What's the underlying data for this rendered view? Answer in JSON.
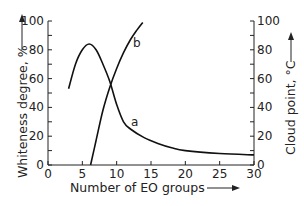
{
  "chart_data": {
    "type": "line",
    "title": "",
    "xlabel": "Number of EO groups",
    "ylabel_left": "Whiteness degree, %",
    "ylabel_right": "Cloud point, °C",
    "xlim": [
      0,
      30
    ],
    "ylim_left": [
      0,
      100
    ],
    "ylim_right": [
      0,
      100
    ],
    "x_ticks": [
      "0",
      "5",
      "10",
      "15",
      "20",
      "25",
      "30"
    ],
    "y_ticks_left": [
      "0",
      "20",
      "40",
      "60",
      "80",
      "100"
    ],
    "y_ticks_right": [
      "0",
      "20",
      "40",
      "60",
      "80",
      "100"
    ],
    "grid": false,
    "series": [
      {
        "name": "a",
        "axis": "left",
        "label": "a",
        "x": [
          3,
          4,
          5,
          6,
          7,
          8,
          9,
          10,
          11,
          12,
          14,
          16,
          18,
          20,
          25,
          30
        ],
        "y": [
          53,
          70,
          80,
          84,
          80,
          70,
          58,
          42,
          30,
          25,
          19,
          15,
          12,
          10,
          8,
          7
        ]
      },
      {
        "name": "b",
        "axis": "right",
        "label": "b",
        "x": [
          6.2,
          7,
          8,
          9,
          10,
          11,
          12,
          13,
          13.8
        ],
        "y": [
          0,
          17,
          38,
          54,
          67,
          78,
          87,
          94,
          99
        ]
      }
    ]
  }
}
